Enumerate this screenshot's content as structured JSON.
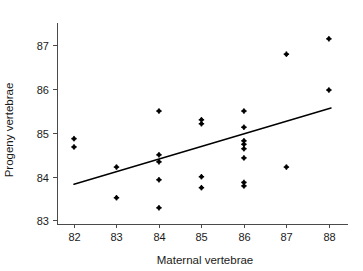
{
  "chart_data": {
    "type": "scatter",
    "title": "",
    "xlabel": "Maternal vertebrae",
    "ylabel": "Progeny vertebrae",
    "xlim": [
      81.6,
      88.45
    ],
    "ylim": [
      82.92,
      87.42
    ],
    "xticks": [
      82,
      83,
      84,
      85,
      86,
      87,
      88
    ],
    "xtick_labels": [
      "82",
      "83",
      "84",
      "85",
      "86",
      "87",
      "88"
    ],
    "yticks": [
      83,
      84,
      85,
      86,
      87
    ],
    "ytick_labels": [
      "83",
      "84",
      "85",
      "86",
      "87"
    ],
    "grid": false,
    "legend": null,
    "marker_color": "#000000",
    "line_color": "#000000",
    "axis_color": "#4a4a4a",
    "points": [
      {
        "x": 82,
        "y": 84.87
      },
      {
        "x": 82,
        "y": 84.68
      },
      {
        "x": 83,
        "y": 84.22
      },
      {
        "x": 83,
        "y": 83.52
      },
      {
        "x": 84,
        "y": 85.5
      },
      {
        "x": 84,
        "y": 84.5
      },
      {
        "x": 84,
        "y": 84.34
      },
      {
        "x": 84,
        "y": 83.93
      },
      {
        "x": 84,
        "y": 83.29
      },
      {
        "x": 85,
        "y": 85.3
      },
      {
        "x": 85,
        "y": 85.21
      },
      {
        "x": 85,
        "y": 84.0
      },
      {
        "x": 85,
        "y": 83.75
      },
      {
        "x": 86,
        "y": 85.5
      },
      {
        "x": 86,
        "y": 85.13
      },
      {
        "x": 86,
        "y": 84.82
      },
      {
        "x": 86,
        "y": 84.74
      },
      {
        "x": 86,
        "y": 84.64
      },
      {
        "x": 86,
        "y": 84.43
      },
      {
        "x": 86,
        "y": 83.87
      },
      {
        "x": 86,
        "y": 83.79
      },
      {
        "x": 87,
        "y": 86.8
      },
      {
        "x": 87,
        "y": 84.22
      },
      {
        "x": 88,
        "y": 87.15
      },
      {
        "x": 88,
        "y": 85.98
      }
    ],
    "fit_line": {
      "label": "regression line",
      "x": [
        82.0,
        88.05
      ],
      "y": [
        83.83,
        85.57
      ]
    }
  }
}
